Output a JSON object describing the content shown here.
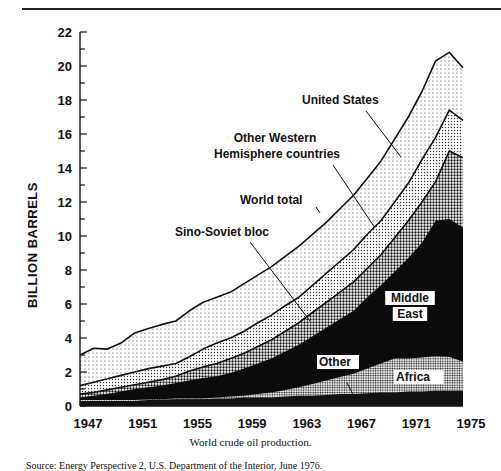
{
  "chart_data": {
    "type": "area",
    "stacked": true,
    "title": "",
    "caption": "World crude oil production.",
    "source": "Source: Energy Perspective 2, U.S. Department of the Interior, June 1976.",
    "xlabel": "",
    "ylabel": "BILLION BARRELS",
    "ylim": [
      0,
      22
    ],
    "xlim": [
      1947,
      1975
    ],
    "yticks": [
      0,
      2,
      4,
      6,
      8,
      10,
      12,
      14,
      16,
      18,
      20,
      22
    ],
    "xticks": [
      1947,
      1951,
      1955,
      1959,
      1963,
      1967,
      1971,
      1975
    ],
    "x": [
      1947,
      1948,
      1949,
      1950,
      1951,
      1952,
      1953,
      1954,
      1955,
      1956,
      1957,
      1958,
      1959,
      1960,
      1961,
      1962,
      1963,
      1964,
      1965,
      1966,
      1967,
      1968,
      1969,
      1970,
      1971,
      1972,
      1973,
      1974,
      1975
    ],
    "cumulative_tops": {
      "Other": [
        0.3,
        0.3,
        0.3,
        0.3,
        0.3,
        0.35,
        0.35,
        0.4,
        0.4,
        0.4,
        0.45,
        0.45,
        0.5,
        0.5,
        0.5,
        0.55,
        0.6,
        0.6,
        0.65,
        0.7,
        0.7,
        0.75,
        0.8,
        0.8,
        0.85,
        0.85,
        0.9,
        0.9,
        0.9
      ],
      "Africa": [
        0.35,
        0.35,
        0.35,
        0.35,
        0.35,
        0.4,
        0.4,
        0.45,
        0.45,
        0.45,
        0.5,
        0.55,
        0.6,
        0.7,
        0.8,
        0.95,
        1.1,
        1.3,
        1.5,
        1.7,
        1.9,
        2.2,
        2.5,
        2.8,
        2.8,
        2.85,
        2.95,
        2.9,
        2.6
      ],
      "Middle East": [
        0.5,
        0.6,
        0.7,
        0.85,
        1.0,
        1.1,
        1.2,
        1.35,
        1.5,
        1.65,
        1.75,
        1.95,
        2.2,
        2.5,
        2.8,
        3.2,
        3.6,
        4.1,
        4.6,
        5.1,
        5.6,
        6.4,
        7.1,
        7.9,
        8.7,
        9.6,
        10.9,
        11.0,
        10.5
      ],
      "Sino-Soviet bloc": [
        0.7,
        0.8,
        0.95,
        1.1,
        1.25,
        1.4,
        1.55,
        1.75,
        2.05,
        2.3,
        2.5,
        2.8,
        3.1,
        3.5,
        3.9,
        4.4,
        4.9,
        5.5,
        6.1,
        6.7,
        7.3,
        8.1,
        8.9,
        9.9,
        10.9,
        12.0,
        13.2,
        15.0,
        14.6
      ],
      "Other Western Hemisphere countries": [
        1.2,
        1.4,
        1.6,
        1.8,
        2.0,
        2.2,
        2.35,
        2.5,
        2.9,
        3.35,
        3.7,
        4.0,
        4.4,
        4.9,
        5.35,
        5.9,
        6.4,
        7.1,
        7.8,
        8.5,
        9.2,
        10.1,
        10.9,
        12.0,
        13.1,
        14.5,
        15.8,
        17.4,
        16.8
      ],
      "United States": [
        3.0,
        3.4,
        3.35,
        3.7,
        4.3,
        4.55,
        4.8,
        5.0,
        5.6,
        6.1,
        6.4,
        6.7,
        7.2,
        7.7,
        8.2,
        8.8,
        9.4,
        10.1,
        10.8,
        11.6,
        12.4,
        13.4,
        14.4,
        15.7,
        17.0,
        18.5,
        20.3,
        20.8,
        19.9
      ]
    },
    "series_order_bottom_to_top": [
      "Other",
      "Africa",
      "Middle East",
      "Sino-Soviet bloc",
      "Other Western Hemisphere countries",
      "United States"
    ],
    "world_total_line": "top of United States layer",
    "annotations": [
      "United States",
      "Other Western Hemisphere countries",
      "World total",
      "Sino-Soviet bloc",
      "Middle East",
      "Other",
      "Africa"
    ],
    "grid": false,
    "legend": "inline labels with pointer lines"
  },
  "labels": {
    "us": "United States",
    "owh1": "Other Western",
    "owh2": "Hemisphere countries",
    "world": "World total",
    "sino": "Sino-Soviet bloc",
    "me1": "Middle",
    "me2": "East",
    "other": "Other",
    "africa": "Africa"
  },
  "colors": {
    "ink": "#111111",
    "paper": "#ffffff"
  }
}
